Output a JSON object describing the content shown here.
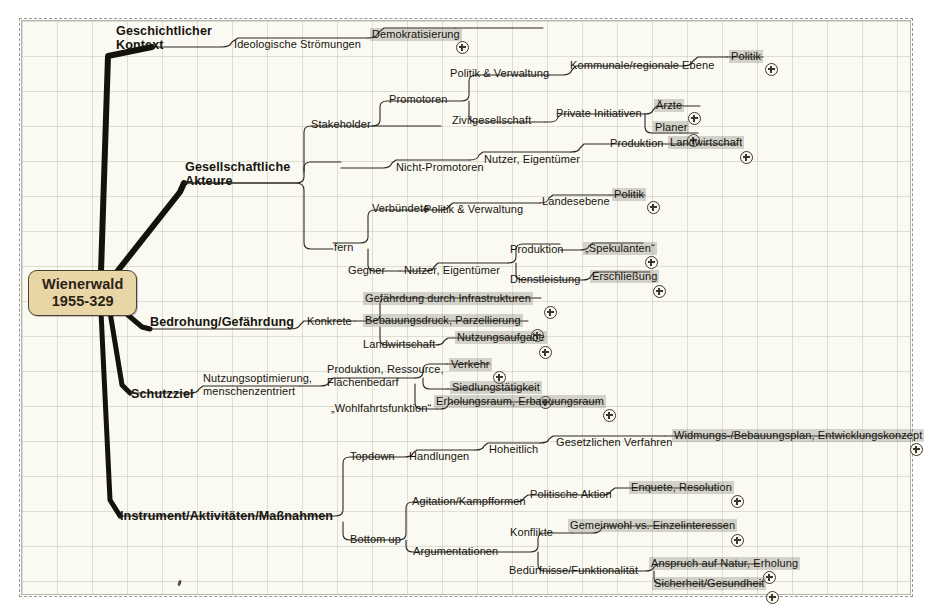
{
  "sheet": {
    "bg_color": "#fbfaf2",
    "grid_color": "#96968c",
    "border_color": "#787668"
  },
  "root": {
    "line1": "Wienerwald",
    "line2": "1955-329",
    "fill_color": "#e9d6a6",
    "border_color": "#4a4330"
  },
  "branches": {
    "geschichtlicher": {
      "line1": "Geschichtlicher",
      "line2": "Kontext"
    },
    "gesellschaftliche": {
      "line1": "Gesellschaftliche",
      "line2": "Akteure"
    },
    "bedrohung": {
      "line1": "Bedrohung/Gefährdung"
    },
    "schutzziel": {
      "line1": "Schutzziel"
    },
    "instrument": {
      "line1": "Instrument/Aktivitäten/Maßnahmen"
    }
  },
  "mid": {
    "ideologische": "Ideologische Strömungen",
    "stakeholder": "Stakeholder",
    "fern": "fern",
    "promotoren": "Promotoren",
    "nicht_promotoren": "Nicht-Promotoren",
    "politik_verwaltung_1": "Politik & Verwaltung",
    "zivilgesellschaft": "Zivilgesellschaft",
    "nutzer_eigentuemer_1": "Nutzer, Eigentümer",
    "verbuendete": "Verbündete",
    "gegner": "Gegner",
    "politik_verwaltung_2": "Politik & Verwaltung",
    "nutzer_eigentuemer_2": "Nutzer, Eigentümer",
    "kommunale": "Kommunale/regionale Ebene",
    "private_initiativen": "Private Initiativen",
    "produktion_1": "Produktion",
    "landesebene": "Landesebene",
    "produktion_2": "Produktion",
    "dienstleistung": "Dienstleistung",
    "konkrete": "Konkrete",
    "landwirtschaft_mid": "Landwirtschaft",
    "nutzungsoptimierung_l1": "Nutzungsoptimierung,",
    "nutzungsoptimierung_l2": "menschenzentriert",
    "produktion_ressource_l1": "Produktion, Ressource,",
    "produktion_ressource_l2": "Flächenbedarf",
    "wohlfahrtsfunktion": "„Wohlfahrtsfunktion“",
    "topdown": "Topdown",
    "bottom_up": "Bottom up",
    "handlungen": "Handlungen",
    "hoheitlich": "Hoheitlich",
    "gesetzlichen_verfahren": "Gesetzlichen Verfahren",
    "agitation": "Agitation/Kampfformen",
    "argumentationen": "Argumentationen",
    "politische_aktion": "Politische Aktion",
    "konflikte": "Konflikte",
    "beduerfnisse": "Bedürfnisse/Funktionalität"
  },
  "leaves": {
    "demokratisierung": "Demokratisierung",
    "politik_1": "Politik",
    "aerzte": "Ärzte",
    "planer": "Planer",
    "landwirtschaft_leaf": "Landwirtschaft",
    "politik_2": "Politik",
    "spekulanten": "„Spekulanten“",
    "erschliessung": "Erschließung",
    "gefaehrdung_infra": "Gefährdung durch Infrastrukturen",
    "bebauungsdruck": "Bebauungsdruck, Parzellierung",
    "nutzungsaufgabe": "Nutzungsaufgabe",
    "verkehr": "Verkehr",
    "siedlungstaetigkeit": "Siedlungstätigkeit",
    "erholungsraum": "Erholungsraum, Erbauuungsraum",
    "widmungsplan": "Widmungs-/Bebauungsplan, Entwicklungskonzept",
    "enquete": "Enquete, Resolution",
    "gemeinwohl": "Gemeinwohl vs. Einzelinteressen",
    "anspruch_natur": "Anspruch auf Natur, Erholung",
    "sicherheit": "Sicherheit/Gesundheit"
  }
}
